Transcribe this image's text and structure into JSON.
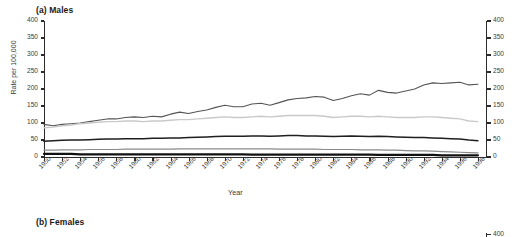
{
  "figure": {
    "panel_a_title": "(a) Males",
    "panel_b_title": "(b) Females",
    "panel_b_first_ytick": "400"
  },
  "chart_data": {
    "type": "line",
    "title": "(a) Males",
    "xlabel": "Year",
    "ylabel": "Rate per 100,000",
    "xlim": [
      1950,
      1999
    ],
    "ylim": [
      0,
      400
    ],
    "grid": false,
    "legend": "none",
    "yticks": [
      0,
      50,
      100,
      150,
      200,
      250,
      300,
      350,
      400
    ],
    "ytick_labels": [
      "0",
      "50",
      "100",
      "150",
      "200",
      "250",
      "300",
      "350",
      "400"
    ],
    "right_axis": true,
    "right_ytick_labels": [
      "0",
      "50",
      "100",
      "150",
      "200",
      "250",
      "300",
      "350",
      "400"
    ],
    "xticks": [
      1950,
      1952,
      1954,
      1956,
      1958,
      1960,
      1962,
      1964,
      1966,
      1968,
      1970,
      1972,
      1974,
      1976,
      1978,
      1980,
      1982,
      1984,
      1986,
      1988,
      1990,
      1992,
      1994,
      1996,
      1998
    ],
    "xtick_labels": [
      "1950",
      "1952",
      "1954",
      "1956",
      "1958",
      "1960",
      "1962",
      "1964",
      "1966",
      "1968",
      "1970",
      "1972",
      "1974",
      "1976",
      "1978",
      "1980",
      "1982",
      "1984",
      "1986",
      "1988",
      "1990",
      "1992",
      "1994",
      "1996",
      "1998"
    ],
    "x": [
      1950,
      1951,
      1952,
      1953,
      1954,
      1955,
      1956,
      1957,
      1958,
      1959,
      1960,
      1961,
      1962,
      1963,
      1964,
      1965,
      1966,
      1967,
      1968,
      1969,
      1970,
      1971,
      1972,
      1973,
      1974,
      1975,
      1976,
      1977,
      1978,
      1979,
      1980,
      1981,
      1982,
      1983,
      1984,
      1985,
      1986,
      1987,
      1988,
      1989,
      1990,
      1991,
      1992,
      1993,
      1994,
      1995,
      1996,
      1997,
      1998
    ],
    "series": [
      {
        "name": "series-1",
        "color": "#555555",
        "width": 1.1,
        "values": [
          96,
          92,
          96,
          98,
          100,
          104,
          108,
          112,
          112,
          116,
          118,
          116,
          120,
          118,
          126,
          132,
          128,
          134,
          138,
          146,
          152,
          148,
          148,
          156,
          158,
          152,
          160,
          168,
          172,
          174,
          178,
          176,
          166,
          172,
          180,
          186,
          182,
          196,
          190,
          188,
          194,
          200,
          212,
          218,
          216,
          218,
          220,
          212,
          214
        ]
      },
      {
        "name": "series-2",
        "color": "#c9c9c9",
        "width": 1.4,
        "values": [
          86,
          88,
          92,
          94,
          98,
          100,
          102,
          104,
          104,
          106,
          106,
          104,
          106,
          106,
          108,
          110,
          110,
          112,
          114,
          116,
          118,
          116,
          116,
          118,
          120,
          118,
          120,
          122,
          122,
          122,
          122,
          120,
          116,
          118,
          120,
          120,
          118,
          120,
          118,
          116,
          116,
          116,
          118,
          118,
          116,
          114,
          112,
          106,
          104
        ]
      },
      {
        "name": "series-3",
        "color": "#1f1f1f",
        "width": 1.5,
        "values": [
          46,
          48,
          49,
          50,
          50,
          51,
          52,
          53,
          53,
          54,
          54,
          54,
          55,
          55,
          56,
          56,
          57,
          58,
          59,
          60,
          61,
          61,
          61,
          62,
          62,
          61,
          62,
          63,
          63,
          62,
          62,
          61,
          60,
          61,
          62,
          61,
          60,
          61,
          60,
          59,
          58,
          57,
          57,
          56,
          55,
          54,
          53,
          50,
          48
        ]
      },
      {
        "name": "series-4",
        "color": "#8a8a8a",
        "width": 1.2,
        "values": [
          20,
          20,
          21,
          21,
          21,
          22,
          22,
          22,
          22,
          23,
          23,
          23,
          23,
          23,
          23,
          24,
          24,
          24,
          24,
          24,
          24,
          24,
          24,
          24,
          24,
          24,
          23,
          23,
          23,
          23,
          23,
          22,
          22,
          22,
          22,
          21,
          21,
          21,
          20,
          20,
          19,
          18,
          18,
          17,
          16,
          15,
          14,
          13,
          12
        ]
      },
      {
        "name": "series-5",
        "color": "#111111",
        "width": 2.2,
        "values": [
          9,
          9,
          9,
          9,
          8,
          8,
          8,
          8,
          8,
          8,
          8,
          8,
          8,
          8,
          8,
          8,
          8,
          8,
          8,
          8,
          8,
          8,
          8,
          7,
          7,
          7,
          7,
          7,
          7,
          7,
          7,
          7,
          7,
          7,
          7,
          7,
          7,
          6,
          6,
          6,
          6,
          6,
          6,
          6,
          5,
          5,
          5,
          5,
          5
        ]
      }
    ]
  }
}
